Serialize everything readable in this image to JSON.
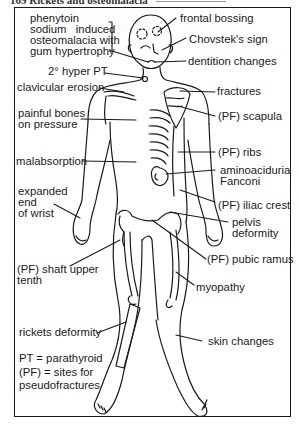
{
  "header": {
    "title": "169 Rickets and osteomalacia"
  },
  "figure": {
    "labels": {
      "phenytoin": [
        "phenytoin",
        "sodium   induced",
        "osteomalacia with",
        "gum hypertrophy"
      ],
      "frontal_bossing": "frontal bossing",
      "chvostek": "Chovstek's sign",
      "dentition": "dentition changes",
      "hyper_pt": "2° hyper PT",
      "clavicular": "clavicular erosion",
      "fractures": "fractures",
      "painful_bones": [
        "painful bones",
        "on pressure"
      ],
      "scapula": "(PF) scapula",
      "ribs": "(PF) ribs",
      "malabsorption": "malabsorption",
      "aminoaciduria": [
        "aminoaciduria",
        "Fanconi"
      ],
      "expanded_wrist": [
        "expanded",
        "end",
        "of wrist"
      ],
      "iliac_crest": "(PF) iliac crest",
      "pelvis": [
        "pelvis",
        "deformity"
      ],
      "shaft_femur": [
        "(PF) shaft upper",
        "tenth"
      ],
      "pubic_ramus": "(PF) pubic ramus",
      "myopathy": "myopathy",
      "rickets": "rickets deformity",
      "skin": "skin changes"
    },
    "legend": [
      "PT = parathyroid",
      "(PF) = sites for",
      "pseudofractures"
    ]
  }
}
